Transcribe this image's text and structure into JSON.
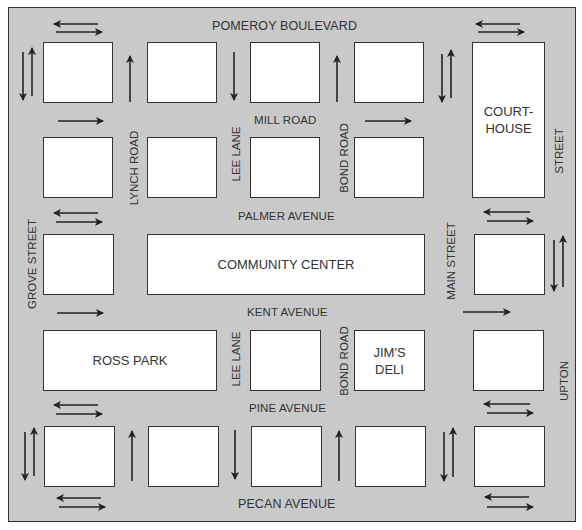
{
  "map": {
    "background_color": "#c9c9c9",
    "block_color": "#ffffff",
    "line_color": "#222222"
  },
  "streets": {
    "horizontal": [
      {
        "name": "POMEROY BOULEVARD"
      },
      {
        "name": "MILL ROAD"
      },
      {
        "name": "PALMER AVENUE"
      },
      {
        "name": "KENT AVENUE"
      },
      {
        "name": "PINE AVENUE"
      },
      {
        "name": "PECAN AVENUE"
      }
    ],
    "vertical": [
      {
        "name": "GROVE STREET"
      },
      {
        "name": "LYNCH ROAD"
      },
      {
        "name": "LEE LANE"
      },
      {
        "name": "BOND ROAD"
      },
      {
        "name": "MAIN STREET"
      },
      {
        "name": "UPTON STREET",
        "label_parts": [
          "STREET",
          "UPTON"
        ]
      }
    ]
  },
  "landmarks": {
    "courthouse": {
      "line1": "COURT-",
      "line2": "HOUSE"
    },
    "community_center": "COMMUNITY CENTER",
    "ross_park": "ROSS PARK",
    "jims_deli": {
      "line1": "JIM'S",
      "line2": "DELI"
    }
  },
  "traffic": {
    "pomeroy_boulevard": "two-way",
    "mill_road": "one-way east",
    "palmer_avenue": "two-way",
    "kent_avenue": "one-way east",
    "pine_avenue": "two-way",
    "pecan_avenue": "two-way",
    "grove_street": "two-way",
    "lynch_road": "one-way north",
    "lee_lane": "one-way south",
    "bond_road": "one-way north",
    "main_street": "two-way",
    "upton_street": "two-way"
  }
}
